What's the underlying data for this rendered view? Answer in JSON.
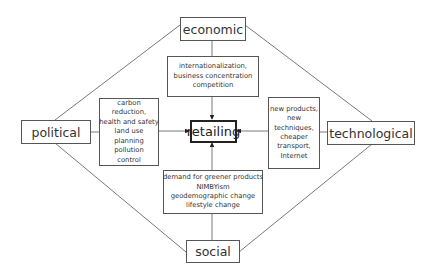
{
  "diagram": {
    "center": {
      "label": "retailing"
    },
    "factors": {
      "economic": {
        "label": "economic",
        "details": [
          "internationalization,",
          "business concentration",
          "competition"
        ]
      },
      "political": {
        "label": "political",
        "details": [
          "carbon",
          "reduction,",
          "health and safety",
          "land use",
          "planning",
          "pollution",
          "control"
        ]
      },
      "technological": {
        "label": "technological",
        "details": [
          "new products,",
          "new",
          "techniques,",
          "cheaper",
          "transport,",
          "Internet"
        ]
      },
      "social": {
        "label": "social",
        "details": [
          "demand for greener products",
          "NIMBYism",
          "geodemographic change",
          "lifestyle change"
        ]
      }
    },
    "colors": {
      "line": "#555555",
      "border": "#555555",
      "center_border": "#222222",
      "text": "#333333"
    }
  }
}
